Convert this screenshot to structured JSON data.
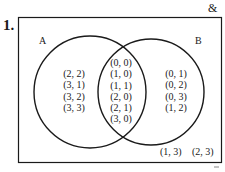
{
  "problem": {
    "number": "1."
  },
  "universe": {
    "symbol": "&"
  },
  "sets": {
    "A": {
      "label": "A"
    },
    "B": {
      "label": "B"
    }
  },
  "regions": {
    "A_only": [
      "(2, 2)",
      "(3, 1)",
      "(3, 2)",
      "(3, 3)"
    ],
    "A_and_B": [
      "(0, 0)",
      "(1, 0)",
      "(1, 1)",
      "(2, 0)",
      "(2, 1)",
      "(3, 0)"
    ],
    "B_only": [
      "(0, 1)",
      "(0, 2)",
      "(0, 3)",
      "(1, 2)"
    ],
    "outside": [
      "(1, 3)",
      "(2, 3)"
    ]
  },
  "colors": {
    "stroke": "#1a1a1a",
    "background": "#ffffff"
  }
}
